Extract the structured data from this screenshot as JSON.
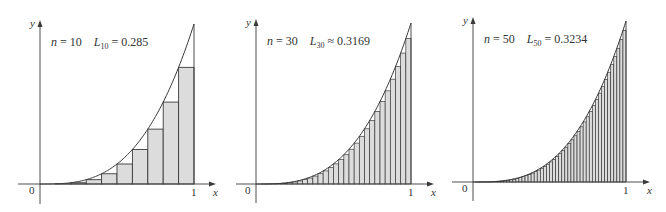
{
  "figure": {
    "style": {
      "rect_fill": "#dcdcdc",
      "stroke": "#3a3a3a",
      "axis": "#3a3a3a",
      "background": "#ffffff"
    }
  },
  "chart_data": [
    {
      "type": "bar",
      "title": "n = 10   L10 = 0.285",
      "n": 10,
      "sum_label": "L",
      "sum_subscript": "10",
      "relation": "=",
      "sum_value": "0.285",
      "function": "x^3",
      "xlabel": "x",
      "ylabel": "y",
      "x_ticks": [
        "0",
        "1"
      ],
      "xlim": [
        0,
        1
      ],
      "ylim": [
        0,
        1
      ],
      "grid": false,
      "categories": [
        0,
        0.1,
        0.2,
        0.3,
        0.4,
        0.5,
        0.6,
        0.7,
        0.8,
        0.9
      ],
      "values": [
        0,
        0.001,
        0.008,
        0.027,
        0.064,
        0.125,
        0.216,
        0.343,
        0.512,
        0.729
      ],
      "panel": {
        "ox": 40,
        "oy": 184,
        "x1": 194,
        "ytop": 24,
        "yaxis_top": 20,
        "yaxis_bottom": 204,
        "xaxis_left": 18,
        "xaxis_right": 216
      }
    },
    {
      "type": "bar",
      "title": "n = 30   L30 ≈ 0.3169",
      "n": 30,
      "sum_label": "L",
      "sum_subscript": "30",
      "relation": "≈",
      "sum_value": "0.3169",
      "function": "x^3",
      "xlabel": "x",
      "ylabel": "y",
      "x_ticks": [
        "0",
        "1"
      ],
      "xlim": [
        0,
        1
      ],
      "ylim": [
        0,
        1
      ],
      "grid": false,
      "panel": {
        "ox": 256,
        "oy": 184,
        "x1": 411,
        "ytop": 23,
        "yaxis_top": 19,
        "yaxis_bottom": 203,
        "xaxis_left": 236,
        "xaxis_right": 434
      }
    },
    {
      "type": "bar",
      "title": "n = 50   L50 = 0.3234",
      "n": 50,
      "sum_label": "L",
      "sum_subscript": "50",
      "relation": "=",
      "sum_value": "0.3234",
      "function": "x^3",
      "xlabel": "x",
      "ylabel": "y",
      "x_ticks": [
        "0",
        "1"
      ],
      "xlim": [
        0,
        1
      ],
      "ylim": [
        0,
        1
      ],
      "grid": false,
      "panel": {
        "ox": 473,
        "oy": 182,
        "x1": 626,
        "ytop": 21,
        "yaxis_top": 17,
        "yaxis_bottom": 201,
        "xaxis_left": 452,
        "xaxis_right": 650
      }
    }
  ]
}
